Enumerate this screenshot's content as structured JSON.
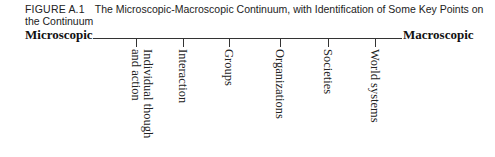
{
  "caption": {
    "figure_number": "FIGURE A.1",
    "title": "The Microscopic-Macroscopic Continuum, with Identification of Some Key Points on the Continuum"
  },
  "continuum": {
    "left_label": "Microscopic",
    "right_label": "Macroscopic",
    "points": [
      {
        "label": "Individual though\nand action",
        "x": 136
      },
      {
        "label": "Interaction",
        "x": 183
      },
      {
        "label": "Groups",
        "x": 229
      },
      {
        "label": "Organizations",
        "x": 280
      },
      {
        "label": "Societies",
        "x": 328
      },
      {
        "label": "World systems",
        "x": 375
      }
    ]
  }
}
